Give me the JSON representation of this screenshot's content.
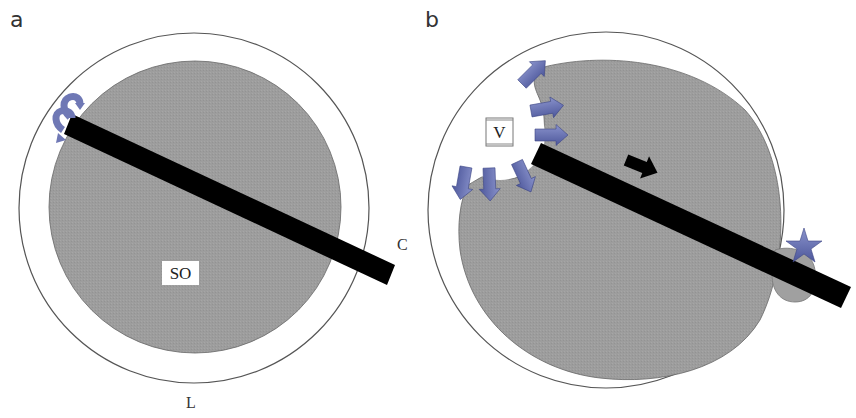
{
  "figure": {
    "panels": [
      {
        "id": "a",
        "letter": "a",
        "labels": {
          "inner": "SO",
          "rod_end": "C",
          "outer_bottom": "L"
        }
      },
      {
        "id": "b",
        "letter": "b",
        "labels": {
          "void": "V"
        }
      }
    ],
    "colors": {
      "gray_fill": "#9c9c9c",
      "rod": "#000000",
      "arrow_blue": "#6670b0",
      "star_blue": "#5a64a8",
      "outline": "#444444"
    }
  }
}
